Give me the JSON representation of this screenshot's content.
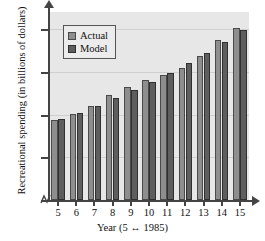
{
  "chart_data": {
    "type": "bar",
    "title": "",
    "xlabel": "Year (5 ↔ 1985)",
    "ylabel": "Recreational spending (in billions of dollars)",
    "categories": [
      "5",
      "6",
      "7",
      "8",
      "9",
      "10",
      "11",
      "12",
      "13",
      "14",
      "15"
    ],
    "series": [
      {
        "name": "Actual",
        "color": "#8e8e8e",
        "values": [
          187,
          202,
          220,
          245,
          264,
          281,
          292,
          310,
          338,
          374,
          402
        ]
      },
      {
        "name": "Model",
        "color": "#5e5e5e",
        "values": [
          190,
          204,
          220,
          238,
          257,
          277,
          298,
          321,
          345,
          370,
          397
        ]
      }
    ],
    "ylim": [
      0,
      440
    ],
    "yticks": [
      100,
      200,
      300,
      400
    ],
    "ytick_labels": [
      "100",
      "200",
      "300",
      "400"
    ],
    "xticks": [
      "5",
      "6",
      "7",
      "8",
      "9",
      "10",
      "11",
      "12",
      "13",
      "14",
      "15"
    ],
    "grid": true,
    "legend_position": "upper-left",
    "axis_break": true,
    "plot_background": "#e7e7e7"
  },
  "legend": {
    "items": [
      {
        "label": "Actual"
      },
      {
        "label": "Model"
      }
    ]
  },
  "icons": {
    "axis_break": "axis-break-zigzag",
    "y_arrow": "arrow-up-icon",
    "x_arrow": "arrow-right-icon"
  }
}
